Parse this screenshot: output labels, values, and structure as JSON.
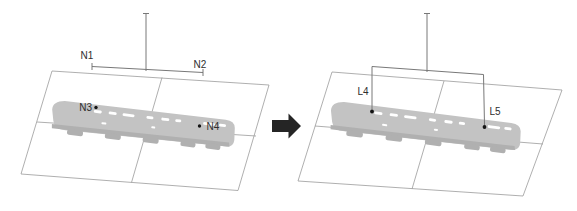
{
  "figure": {
    "panels": {
      "before": {
        "labels": {
          "n1": "N1",
          "n2": "N2",
          "n3": "N3",
          "n4": "N4"
        }
      },
      "after": {
        "labels": {
          "l4": "L4",
          "l5": "L5"
        }
      }
    },
    "icons": {
      "transform_arrow": "right-block-arrow"
    },
    "colors": {
      "background": "#ffffff",
      "plane_line": "#9a9a9a",
      "measure_line": "#787878",
      "vehicle_body": "#c3c3c3",
      "vehicle_underframe": "#b0b0b0",
      "window_speck": "#ffffff",
      "marker_dot": "#141414",
      "label_text": "#2e2e2e",
      "arrow": "#252525"
    }
  }
}
